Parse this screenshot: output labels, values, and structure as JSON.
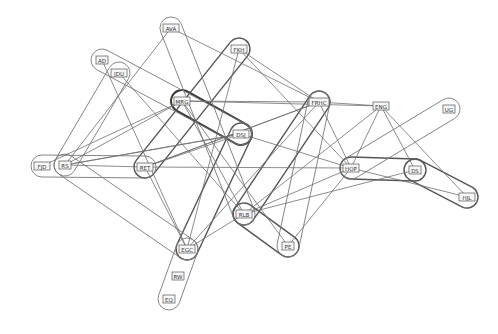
{
  "diagram": {
    "type": "hypergraph",
    "colors": {
      "background": "#ffffff",
      "line": "#6e6e6e",
      "hull_heavy": "#3a3a3a",
      "label_box": "#f6f6f6",
      "label_text": "#333333"
    },
    "nodes": [
      {
        "id": "AVA",
        "label": "AVA",
        "x": 171,
        "y": 28
      },
      {
        "id": "FKH",
        "label": "FKH",
        "x": 239,
        "y": 49
      },
      {
        "id": "AD",
        "label": "AD",
        "x": 102,
        "y": 60
      },
      {
        "id": "JDU",
        "label": "JDU",
        "x": 119,
        "y": 73
      },
      {
        "id": "MRG",
        "label": "MRG",
        "x": 182,
        "y": 101
      },
      {
        "id": "FRHC",
        "label": "FRHC",
        "x": 319,
        "y": 102
      },
      {
        "id": "ENG",
        "label": "ENG",
        "x": 381,
        "y": 106
      },
      {
        "id": "UG",
        "label": "UG",
        "x": 449,
        "y": 109
      },
      {
        "id": "DSJ",
        "label": "DSJ",
        "x": 241,
        "y": 134
      },
      {
        "id": "FJD",
        "label": "FJD",
        "x": 42,
        "y": 166
      },
      {
        "id": "RS",
        "label": "RS",
        "x": 65,
        "y": 165
      },
      {
        "id": "RET",
        "label": "RET",
        "x": 145,
        "y": 167
      },
      {
        "id": "HOP",
        "label": "HOP",
        "x": 351,
        "y": 168
      },
      {
        "id": "DS",
        "label": "DS",
        "x": 415,
        "y": 170
      },
      {
        "id": "HJL",
        "label": "HJL",
        "x": 467,
        "y": 197
      },
      {
        "id": "RLB",
        "label": "RLB",
        "x": 244,
        "y": 214
      },
      {
        "id": "PE",
        "label": "PE",
        "x": 288,
        "y": 246
      },
      {
        "id": "EGC",
        "label": "EGC",
        "x": 187,
        "y": 249
      },
      {
        "id": "RW",
        "label": "RW",
        "x": 178,
        "y": 276
      },
      {
        "id": "EQ",
        "label": "EQ",
        "x": 169,
        "y": 299
      }
    ],
    "hulls": [
      {
        "members": [
          "MRG",
          "DSJ"
        ],
        "weight": "heavy"
      },
      {
        "members": [
          "FKH",
          "RET"
        ],
        "weight": "medium"
      },
      {
        "members": [
          "FRHC",
          "RLB"
        ],
        "weight": "medium"
      },
      {
        "members": [
          "HOP",
          "DS"
        ],
        "weight": "medium"
      },
      {
        "members": [
          "DS",
          "HJL"
        ],
        "weight": "medium"
      },
      {
        "members": [
          "RLB",
          "PE"
        ],
        "weight": "medium"
      },
      {
        "members": [
          "DSJ",
          "EGC"
        ],
        "weight": "medium"
      },
      {
        "members": [
          "EGC",
          "EQ"
        ],
        "weight": "light"
      },
      {
        "members": [
          "FJD",
          "RET"
        ],
        "weight": "light"
      },
      {
        "members": [
          "AD",
          "DSJ"
        ],
        "weight": "light"
      },
      {
        "members": [
          "JDU",
          "RS"
        ],
        "weight": "light"
      },
      {
        "members": [
          "AVA",
          "RLB"
        ],
        "weight": "light"
      },
      {
        "members": [
          "UG",
          "HOP"
        ],
        "weight": "light"
      },
      {
        "members": [
          "PE",
          "FRHC"
        ],
        "weight": "light"
      },
      {
        "members": [
          "RS",
          "EGC"
        ],
        "weight": "light"
      }
    ],
    "edges": [
      [
        "AVA",
        "FRHC"
      ],
      [
        "AVA",
        "RS"
      ],
      [
        "FKH",
        "FRHC"
      ],
      [
        "FKH",
        "HOP"
      ],
      [
        "FKH",
        "EGC"
      ],
      [
        "AD",
        "EGC"
      ],
      [
        "JDU",
        "RLB"
      ],
      [
        "MRG",
        "FRHC"
      ],
      [
        "MRG",
        "ENG"
      ],
      [
        "MRG",
        "RLB"
      ],
      [
        "MRG",
        "RS"
      ],
      [
        "MRG",
        "PE"
      ],
      [
        "FRHC",
        "ENG"
      ],
      [
        "FRHC",
        "HOP"
      ],
      [
        "FRHC",
        "EGC"
      ],
      [
        "FRHC",
        "RET"
      ],
      [
        "ENG",
        "HOP"
      ],
      [
        "ENG",
        "DS"
      ],
      [
        "ENG",
        "RLB"
      ],
      [
        "ENG",
        "HJL"
      ],
      [
        "DSJ",
        "RS"
      ],
      [
        "DSJ",
        "HOP"
      ],
      [
        "DSJ",
        "RET"
      ],
      [
        "RET",
        "EGC"
      ],
      [
        "RET",
        "HOP"
      ],
      [
        "RS",
        "DSJ"
      ],
      [
        "HOP",
        "RLB"
      ],
      [
        "HOP",
        "HJL"
      ],
      [
        "HOP",
        "PE"
      ],
      [
        "RLB",
        "EGC"
      ],
      [
        "RLB",
        "DS"
      ],
      [
        "RS",
        "RET"
      ],
      [
        "FJD",
        "MRG"
      ],
      [
        "RET",
        "FRHC"
      ]
    ]
  }
}
